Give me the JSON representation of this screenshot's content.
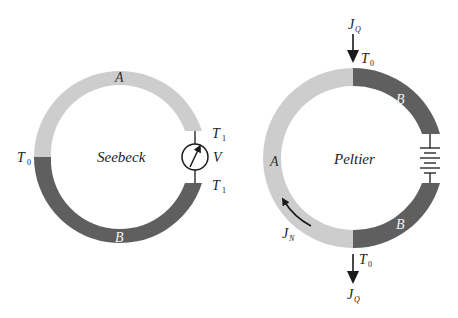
{
  "colors": {
    "material_a": "#cdcdcd",
    "material_b": "#5f5f5f",
    "ink": "#1a1a1a",
    "label_on_dark": "#f2f2f2"
  },
  "seebeck": {
    "title": "Seebeck",
    "material_top": "A",
    "material_bottom": "B",
    "junction_left": {
      "T": "T",
      "sub": "0"
    },
    "junction_right_top": {
      "T": "T",
      "sub": "1"
    },
    "junction_right_bottom": {
      "T": "T",
      "sub": "1"
    },
    "meter_label": "V",
    "meter_icon": "voltmeter-icon"
  },
  "peltier": {
    "title": "Peltier",
    "material_left": "A",
    "material_right_top": "B",
    "material_right_bottom": "B",
    "junction_top": {
      "T": "T",
      "sub": "0"
    },
    "junction_bottom": {
      "T": "T",
      "sub": "0"
    },
    "heat_flow_in": {
      "J": "J",
      "sub": "Q"
    },
    "heat_flow_out": {
      "J": "J",
      "sub": "Q"
    },
    "particle_flow": {
      "J": "J",
      "sub": "N"
    },
    "source_icon": "battery-icon"
  }
}
